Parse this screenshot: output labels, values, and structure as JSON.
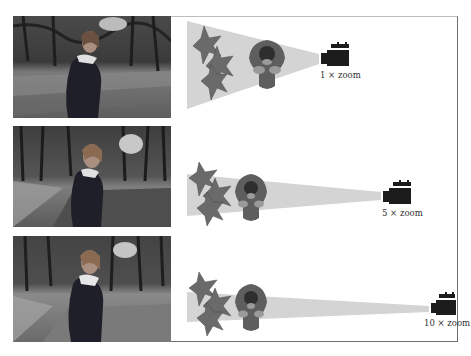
{
  "figure": {
    "colors": {
      "cone": "#d4d4d4",
      "person_body": "#5e5e5e",
      "person_head": "#2e2e2e",
      "person_skin": "#9a9a9a",
      "camera": "#1c1c1c",
      "foliage": "#6a6a6a",
      "frame_border": "#6e6e6e"
    },
    "rows": [
      {
        "zoom_label": "1 × zoom",
        "photo_desc": "Woman in park, wide framing"
      },
      {
        "zoom_label": "5 × zoom",
        "photo_desc": "Woman in park, medium framing"
      },
      {
        "zoom_label": "10 × zoom",
        "photo_desc": "Woman in park, narrow framing"
      }
    ]
  }
}
